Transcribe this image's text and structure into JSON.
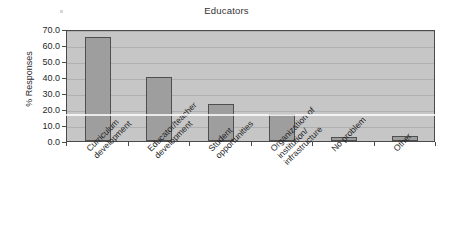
{
  "chart_data": {
    "type": "bar",
    "title": "Educators",
    "xlabel": "",
    "ylabel": "% Responses",
    "ylim": [
      0,
      70
    ],
    "ytick_step": 10,
    "grid": true,
    "legend": "none",
    "categories": [
      "Curriculum\ndevelopment",
      "Educator/teacher\ndevelopment",
      "Student\nopportunities",
      "Organization of\ninstitution/\ninfrastructure",
      "No problem",
      "Other"
    ],
    "values": [
      65.0,
      40.0,
      23.3,
      16.7,
      2.5,
      3.0
    ],
    "ytick_labels": [
      "70.0",
      "60.0",
      "50.0",
      "40.0",
      "30.0",
      "20.0",
      "10.0",
      "0.0"
    ],
    "ytick_values": [
      70,
      60,
      50,
      40,
      30,
      20,
      10,
      0
    ],
    "bar_fill_color": "#9e9e9e",
    "bar_edge_color": "#4f4f4f",
    "plot_background_color": "#c6c6c6",
    "gridline_color": "#b0b0b0",
    "axis_color": "#4a4a4a"
  },
  "figure": {
    "title": "Educators",
    "y_axis_title": "% Responses",
    "caption_fragment": ""
  }
}
